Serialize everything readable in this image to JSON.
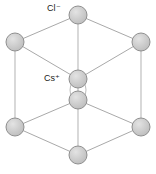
{
  "figure": {
    "type": "crystal-lattice-diagram",
    "background_color": "#ffffff",
    "width": 156,
    "height": 174
  },
  "labels": [
    {
      "id": "chloride",
      "symbol": "Cl",
      "charge": "−",
      "text": "Cl⁻",
      "x": 47,
      "y": 4,
      "color": "#1a1a1a"
    },
    {
      "id": "caesium",
      "symbol": "Cs",
      "charge": "+",
      "text": "Cs⁺",
      "x": 44,
      "y": 74,
      "color": "#1a1a1a"
    }
  ],
  "style": {
    "sphere_fill": "#c9c9c9",
    "sphere_fill_light": "#dcdcdc",
    "sphere_stroke": "#8a8a8a",
    "edge_color": "#b0b0b0",
    "edge_color_dark": "#9a9a9a",
    "vertical_edge_color": "#c4c4c4",
    "arc_color": "#b8b8b8",
    "sphere_radius": 9,
    "edge_width": 1
  },
  "atoms": [
    {
      "name": "cl-top-back",
      "species": "Cl⁻",
      "cx": 78,
      "cy": 15,
      "r": 9
    },
    {
      "name": "cl-upper-left",
      "species": "Cl⁻",
      "cx": 15,
      "cy": 42,
      "r": 9
    },
    {
      "name": "cl-upper-right",
      "species": "Cl⁻",
      "cx": 141,
      "cy": 42,
      "r": 9
    },
    {
      "name": "cl-top-front",
      "species": "Cl⁻",
      "cx": 78,
      "cy": 79,
      "r": 9
    },
    {
      "name": "cs-body-center",
      "species": "Cs⁺",
      "cx": 78,
      "cy": 100,
      "r": 9
    },
    {
      "name": "cl-lower-left",
      "species": "Cl⁻",
      "cx": 15,
      "cy": 127,
      "r": 9
    },
    {
      "name": "cl-lower-right",
      "species": "Cl⁻",
      "cx": 141,
      "cy": 127,
      "r": 9
    },
    {
      "name": "cl-bottom-front",
      "species": "Cl⁻",
      "cx": 78,
      "cy": 155,
      "r": 9
    }
  ],
  "edges": [
    {
      "name": "edge-top-back-to-upper-left",
      "x1": 78,
      "y1": 15,
      "x2": 15,
      "y2": 42
    },
    {
      "name": "edge-top-back-to-upper-right",
      "x1": 78,
      "y1": 15,
      "x2": 141,
      "y2": 42
    },
    {
      "name": "edge-upper-left-to-top-front",
      "x1": 15,
      "y1": 42,
      "x2": 78,
      "y2": 79
    },
    {
      "name": "edge-upper-right-to-top-front",
      "x1": 141,
      "y1": 42,
      "x2": 78,
      "y2": 79
    },
    {
      "name": "edge-lower-left-to-center-lower",
      "x1": 15,
      "y1": 127,
      "x2": 78,
      "y2": 100
    },
    {
      "name": "edge-lower-right-to-center-lower",
      "x1": 141,
      "y1": 127,
      "x2": 78,
      "y2": 100
    },
    {
      "name": "edge-lower-left-to-bottom",
      "x1": 15,
      "y1": 127,
      "x2": 78,
      "y2": 155
    },
    {
      "name": "edge-lower-right-to-bottom",
      "x1": 141,
      "y1": 127,
      "x2": 78,
      "y2": 155
    },
    {
      "name": "edge-vertical-left",
      "x1": 15,
      "y1": 42,
      "x2": 15,
      "y2": 127
    },
    {
      "name": "edge-vertical-right",
      "x1": 141,
      "y1": 42,
      "x2": 141,
      "y2": 127
    },
    {
      "name": "edge-vertical-back",
      "x1": 78,
      "y1": 15,
      "x2": 78,
      "y2": 100
    },
    {
      "name": "edge-vertical-front",
      "x1": 78,
      "y1": 100,
      "x2": 78,
      "y2": 155
    }
  ],
  "arc": {
    "name": "center-connector-arc",
    "cx": 78,
    "cy": 90,
    "rx": 8,
    "ry": 11
  }
}
